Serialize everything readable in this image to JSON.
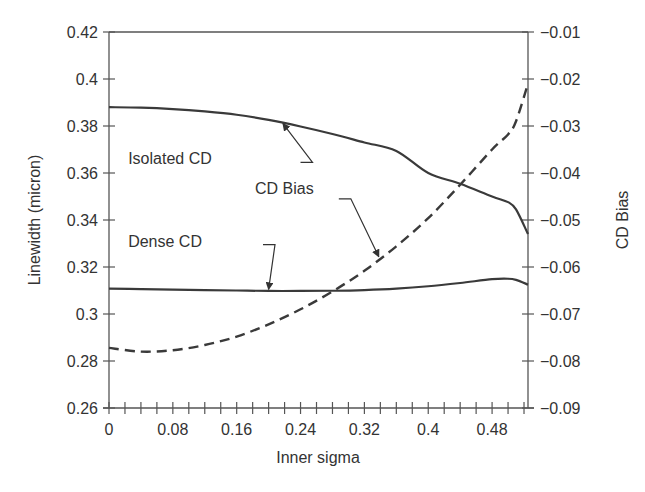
{
  "chart_data": {
    "type": "line",
    "title": "",
    "xlabel": "Inner sigma",
    "ylabel": "Linewidth (micron)",
    "y2label": "CD Bias",
    "xlim": [
      0,
      0.525
    ],
    "ylim": [
      0.26,
      0.42
    ],
    "y2lim": [
      -0.09,
      -0.01
    ],
    "grid": false,
    "legend": "none (inline annotations with arrows)",
    "x_ticks": [
      0,
      0.08,
      0.16,
      0.24,
      0.32,
      0.4,
      0.48
    ],
    "x_tick_labels": [
      "0",
      "0.08",
      "0.16",
      "0.24",
      "0.32",
      "0.4",
      "0.48"
    ],
    "x_minor_tick_step": 0.02,
    "y_ticks": [
      0.26,
      0.28,
      0.3,
      0.32,
      0.34,
      0.36,
      0.38,
      0.4,
      0.42
    ],
    "y_tick_labels": [
      "0.26",
      "0.28",
      "0.3",
      "0.32",
      "0.34",
      "0.36",
      "0.38",
      "0.4",
      "0.42"
    ],
    "y2_ticks": [
      -0.09,
      -0.08,
      -0.07,
      -0.06,
      -0.05,
      -0.04,
      -0.03,
      -0.02,
      -0.01
    ],
    "y2_tick_labels": [
      "−0.09",
      "−0.08",
      "−0.07",
      "−0.06",
      "−0.05",
      "−0.04",
      "−0.03",
      "−0.02",
      "−0.01"
    ],
    "x": [
      0,
      0.04,
      0.08,
      0.12,
      0.16,
      0.2,
      0.24,
      0.28,
      0.32,
      0.36,
      0.4,
      0.44,
      0.48,
      0.5,
      0.51,
      0.525
    ],
    "series": [
      {
        "name": "Isolated CD",
        "axis": "left",
        "style": "solid",
        "values": [
          0.388,
          0.3878,
          0.3872,
          0.3862,
          0.3848,
          0.3826,
          0.3798,
          0.3766,
          0.373,
          0.3694,
          0.36,
          0.3554,
          0.35,
          0.3476,
          0.3445,
          0.334
        ]
      },
      {
        "name": "Dense CD",
        "axis": "left",
        "style": "solid",
        "values": [
          0.3108,
          0.3106,
          0.3104,
          0.3102,
          0.31,
          0.3098,
          0.3098,
          0.3099,
          0.3102,
          0.3108,
          0.3118,
          0.3132,
          0.3148,
          0.315,
          0.3145,
          0.3125
        ]
      },
      {
        "name": "CD Bias",
        "axis": "right",
        "style": "dashed",
        "values": [
          -0.0772,
          -0.078,
          -0.0777,
          -0.0766,
          -0.0748,
          -0.0722,
          -0.069,
          -0.0652,
          -0.0608,
          -0.0556,
          -0.0496,
          -0.0425,
          -0.035,
          -0.0318,
          -0.029,
          -0.021
        ]
      }
    ],
    "annotations": [
      {
        "text": "Isolated CD",
        "series": "Isolated CD",
        "label_x": 0.024,
        "label_y": 0.364,
        "arrow_from": [
          0.255,
          0.3645
        ],
        "arrow_to": [
          0.218,
          0.381
        ]
      },
      {
        "text": "Dense CD",
        "series": "Dense CD",
        "label_x": 0.024,
        "label_y": 0.3285,
        "arrow_from": [
          0.208,
          0.3295
        ],
        "arrow_to": [
          0.2,
          0.3105
        ]
      },
      {
        "text": "CD Bias",
        "series": "CD Bias",
        "label_x": 0.183,
        "label_y": -0.0445,
        "arrow_from": [
          0.303,
          -0.0455
        ],
        "arrow_to": [
          0.338,
          -0.0578
        ]
      }
    ]
  }
}
